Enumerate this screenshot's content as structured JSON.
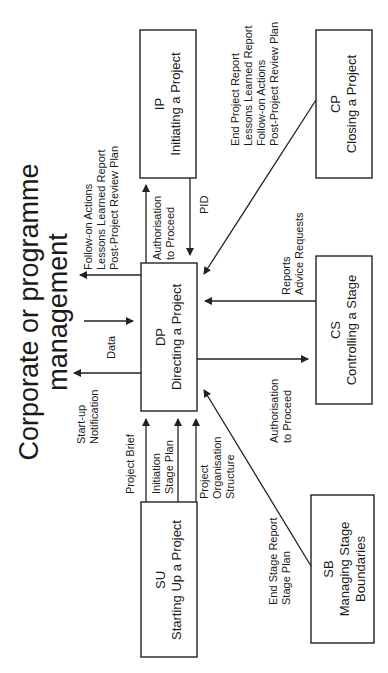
{
  "title": {
    "line1": "Corporate or programme",
    "line2": "management"
  },
  "processes": {
    "ip": {
      "code": "IP",
      "name": "Initiating a Project"
    },
    "dp": {
      "code": "DP",
      "name": "Directing a Project"
    },
    "cp": {
      "code": "CP",
      "name": "Closing a Project"
    },
    "cs": {
      "code": "CS",
      "name": "Controlling a Stage"
    },
    "su": {
      "code": "SU",
      "name": "Starting Up a Project"
    },
    "sb": {
      "code": "SB",
      "name": "Managing Stage",
      "name2": "Boundaries"
    }
  },
  "flows": {
    "dp_to_corp_top": [
      "Follow-on Actions",
      "Lessons Learned Report",
      "Post-Project Review Plan"
    ],
    "corp_to_dp": [
      "Data"
    ],
    "dp_to_corp_bottom": [
      "Start-up",
      "Notification"
    ],
    "dp_to_ip": [
      "Authorisation",
      "to Proceed"
    ],
    "ip_to_dp": [
      "PID"
    ],
    "cp_to_dp": [
      "End Project Report",
      "Lessons Learned Report",
      "Follow-on Actions",
      "Post-Project Review Plan"
    ],
    "cs_to_dp": [
      "Reports",
      "Advice Requests"
    ],
    "dp_to_cs": [
      "Authorisation",
      "to Proceed"
    ],
    "su_to_dp_1": [
      "Project Brief"
    ],
    "su_to_dp_2": [
      "Initiation",
      "Stage Plan"
    ],
    "su_to_dp_3": [
      "Project",
      "Organisation",
      "Structure"
    ],
    "sb_to_dp": [
      "End Stage Report",
      "Stage Plan"
    ]
  }
}
